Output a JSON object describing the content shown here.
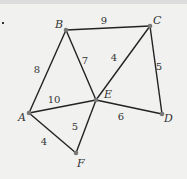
{
  "graph": {
    "nodes": [
      {
        "id": "A",
        "label": "A",
        "x": 29,
        "y": 113,
        "lx": 18,
        "ly": 121
      },
      {
        "id": "B",
        "label": "B",
        "x": 66,
        "y": 30,
        "lx": 55,
        "ly": 28
      },
      {
        "id": "C",
        "label": "C",
        "x": 150,
        "y": 26,
        "lx": 153,
        "ly": 24
      },
      {
        "id": "D",
        "label": "D",
        "x": 162,
        "y": 114,
        "lx": 164,
        "ly": 122
      },
      {
        "id": "E",
        "label": "E",
        "x": 96,
        "y": 100,
        "lx": 104,
        "ly": 98
      },
      {
        "id": "F",
        "label": "F",
        "x": 76,
        "y": 153,
        "lx": 77,
        "ly": 167
      }
    ],
    "edges": [
      {
        "from": "B",
        "to": "C",
        "weight": "9",
        "lx": 104,
        "ly": 24
      },
      {
        "from": "A",
        "to": "B",
        "weight": "8",
        "lx": 37,
        "ly": 73
      },
      {
        "from": "B",
        "to": "E",
        "weight": "7",
        "lx": 85,
        "ly": 64
      },
      {
        "from": "C",
        "to": "E",
        "weight": "4",
        "lx": 114,
        "ly": 61
      },
      {
        "from": "C",
        "to": "D",
        "weight": "5",
        "lx": 159,
        "ly": 70
      },
      {
        "from": "A",
        "to": "E",
        "weight": "10",
        "lx": 54,
        "ly": 103
      },
      {
        "from": "E",
        "to": "D",
        "weight": "6",
        "lx": 121,
        "ly": 120
      },
      {
        "from": "E",
        "to": "F",
        "weight": "5",
        "lx": 75,
        "ly": 130
      },
      {
        "from": "A",
        "to": "F",
        "weight": "4",
        "lx": 44,
        "ly": 145
      }
    ],
    "colors": {
      "edge": "#222222",
      "node": "#777777",
      "text": "#333333"
    }
  }
}
